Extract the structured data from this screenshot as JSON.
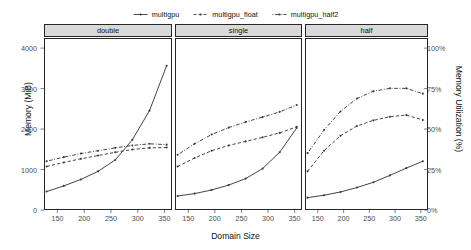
{
  "chart_data": {
    "type": "line",
    "title": "",
    "xlabel": "Domain Size",
    "ylabel": "Memory (MiB)",
    "ylabel_right": "Memory Utilization (%)",
    "xlim": [
      125,
      362
    ],
    "ylim": [
      0,
      4250
    ],
    "xticks": [
      150,
      200,
      250,
      300,
      350
    ],
    "yticks": [
      0,
      1000,
      2000,
      3000,
      4000
    ],
    "yticks_right_values": [
      0,
      1000,
      2000,
      3000,
      4000
    ],
    "yticks_right_labels": [
      "0%",
      "25%",
      "50%",
      "75%",
      "100%"
    ],
    "grid": false,
    "legend_position": "top",
    "facets": [
      "double",
      "single",
      "half"
    ],
    "series_names": [
      "multigpu",
      "multigpu_float",
      "multigpu_half2"
    ],
    "series_styles": [
      "solid",
      "dashed",
      "dotdash"
    ],
    "x": [
      128,
      160,
      192,
      224,
      256,
      288,
      320,
      352
    ],
    "panels": [
      {
        "facet": "double",
        "series": [
          {
            "name": "multigpu",
            "values": [
              480,
              620,
              780,
              980,
              1260,
              1760,
              2480,
              3590
            ]
          },
          {
            "name": "multigpu_float",
            "values": [
              1100,
              1200,
              1290,
              1370,
              1450,
              1520,
              1560,
              1570
            ]
          },
          {
            "name": "multigpu_half2",
            "values": [
              1230,
              1330,
              1420,
              1490,
              1560,
              1620,
              1660,
              1640
            ]
          }
        ]
      },
      {
        "facet": "single",
        "series": [
          {
            "name": "multigpu",
            "values": [
              370,
              430,
              520,
              640,
              800,
              1050,
              1450,
              2050
            ]
          },
          {
            "name": "multigpu_float",
            "values": [
              1100,
              1310,
              1490,
              1620,
              1720,
              1820,
              1930,
              2080
            ]
          },
          {
            "name": "multigpu_half2",
            "values": [
              1390,
              1660,
              1890,
              2060,
              2200,
              2320,
              2450,
              2620
            ]
          }
        ]
      },
      {
        "facet": "half",
        "series": [
          {
            "name": "multigpu",
            "values": [
              330,
              390,
              470,
              580,
              710,
              880,
              1060,
              1230
            ]
          },
          {
            "name": "multigpu_float",
            "values": [
              980,
              1490,
              1860,
              2100,
              2240,
              2330,
              2370,
              2250
            ]
          },
          {
            "name": "multigpu_half2",
            "values": [
              1430,
              2000,
              2460,
              2780,
              2960,
              3030,
              3030,
              2900
            ]
          }
        ]
      }
    ]
  },
  "legend": {
    "entries": [
      {
        "label": "multigpu"
      },
      {
        "label": "multigpu_float"
      },
      {
        "label": "multigpu_half2"
      }
    ]
  },
  "axes": {
    "y_left_title": "Memory (MiB)",
    "y_right_title": "Memory Utilization (%)",
    "x_title": "Domain Size",
    "y_left_ticks": [
      "4000",
      "3000",
      "2000",
      "1000",
      "0"
    ],
    "y_right_ticks": [
      "100%",
      "75%",
      "50%",
      "25%",
      "0%"
    ],
    "x_ticks": [
      "150",
      "200",
      "250",
      "300",
      "350"
    ]
  },
  "strips": [
    {
      "label": "double"
    },
    {
      "label": "single"
    },
    {
      "label": "half"
    }
  ],
  "colors": {
    "line": "#3a3a3a",
    "strip_fill": "#d9d9d9",
    "panel_border": "#262626",
    "text": "#111111",
    "tick_text": "#4d4d4d",
    "background": "#ffffff"
  }
}
